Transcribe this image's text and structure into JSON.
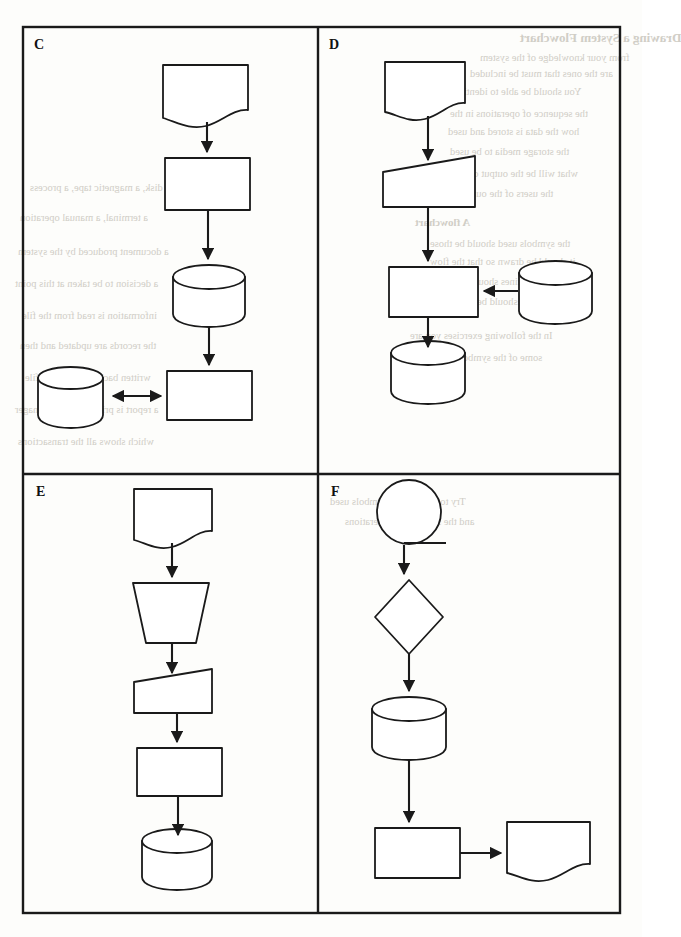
{
  "page": {
    "width": 642,
    "height": 937,
    "background_color": "#fdfdfb",
    "ink_color": "#1a1a1a",
    "bleed_color": "#c9c6bd"
  },
  "figure": {
    "kind": "flowchart-exercise-grid",
    "outer_border": {
      "x": 23,
      "y": 27,
      "width": 597,
      "height": 886
    },
    "divider_vertical_x": 318,
    "divider_horizontal_y": 474,
    "panels": [
      {
        "id": "C",
        "label": "C",
        "label_x": 34,
        "label_y": 48,
        "region": {
          "x": 23,
          "y": 27,
          "width": 295,
          "height": 447
        },
        "nodes": [
          {
            "name": "document",
            "shape": "document",
            "x": 163,
            "y": 65,
            "width": 85,
            "height": 56
          },
          {
            "name": "process",
            "shape": "rectangle",
            "x": 165,
            "y": 158,
            "width": 85,
            "height": 52
          },
          {
            "name": "database",
            "shape": "cylinder",
            "x": 173,
            "y": 264,
            "width": 72,
            "height": 62
          },
          {
            "name": "process-2",
            "shape": "rectangle",
            "x": 167,
            "y": 371,
            "width": 85,
            "height": 49
          },
          {
            "name": "database-2",
            "shape": "cylinder",
            "x": 38,
            "y": 366,
            "width": 65,
            "height": 61
          }
        ],
        "edges": [
          {
            "from": "document",
            "to": "process",
            "direction": "down",
            "arrow": "single"
          },
          {
            "from": "process",
            "to": "database",
            "direction": "down",
            "arrow": "single"
          },
          {
            "from": "database",
            "to": "process-2",
            "direction": "down",
            "arrow": "single"
          },
          {
            "from": "database-2",
            "to": "process-2",
            "direction": "right",
            "arrow": "double"
          }
        ]
      },
      {
        "id": "D",
        "label": "D",
        "label_x": 329,
        "label_y": 48,
        "region": {
          "x": 318,
          "y": 27,
          "width": 302,
          "height": 447
        },
        "nodes": [
          {
            "name": "document",
            "shape": "document",
            "x": 385,
            "y": 62,
            "width": 80,
            "height": 54
          },
          {
            "name": "input-output",
            "shape": "slanted-top-quad",
            "x": 383,
            "y": 156,
            "width": 92,
            "height": 51
          },
          {
            "name": "process",
            "shape": "rectangle",
            "x": 389,
            "y": 267,
            "width": 89,
            "height": 50
          },
          {
            "name": "database-source",
            "shape": "cylinder",
            "x": 519,
            "y": 261,
            "width": 73,
            "height": 62
          },
          {
            "name": "database-sink",
            "shape": "cylinder",
            "x": 391,
            "y": 341,
            "width": 74,
            "height": 62
          }
        ],
        "edges": [
          {
            "from": "document",
            "to": "input-output",
            "direction": "down",
            "arrow": "single"
          },
          {
            "from": "input-output",
            "to": "process",
            "direction": "down",
            "arrow": "single"
          },
          {
            "from": "database-source",
            "to": "process",
            "direction": "left",
            "arrow": "single"
          },
          {
            "from": "process",
            "to": "database-sink",
            "direction": "down",
            "arrow": "single"
          }
        ]
      },
      {
        "id": "E",
        "label": "E",
        "label_x": 36,
        "label_y": 495,
        "region": {
          "x": 23,
          "y": 474,
          "width": 295,
          "height": 439
        },
        "nodes": [
          {
            "name": "document",
            "shape": "document",
            "x": 134,
            "y": 489,
            "width": 78,
            "height": 57
          },
          {
            "name": "manual-operation",
            "shape": "trapezoid",
            "x": 133,
            "y": 583,
            "width": 76,
            "height": 60
          },
          {
            "name": "input-output",
            "shape": "slanted-top-quad",
            "x": 134,
            "y": 669,
            "width": 78,
            "height": 44
          },
          {
            "name": "process",
            "shape": "rectangle",
            "x": 137,
            "y": 748,
            "width": 85,
            "height": 48
          },
          {
            "name": "database",
            "shape": "cylinder",
            "x": 142,
            "y": 829,
            "width": 70,
            "height": 60
          }
        ],
        "edges": [
          {
            "from": "document",
            "to": "manual-operation",
            "direction": "down",
            "arrow": "single"
          },
          {
            "from": "manual-operation",
            "to": "input-output",
            "direction": "down",
            "arrow": "single"
          },
          {
            "from": "input-output",
            "to": "process",
            "direction": "down",
            "arrow": "single"
          },
          {
            "from": "process",
            "to": "database",
            "direction": "down",
            "arrow": "single"
          }
        ]
      },
      {
        "id": "F",
        "label": "F",
        "label_x": 331,
        "label_y": 495,
        "region": {
          "x": 318,
          "y": 474,
          "width": 302,
          "height": 439
        },
        "nodes": [
          {
            "name": "connector-circle",
            "shape": "circle-with-tail",
            "cx": 409,
            "cy": 512,
            "r": 32
          },
          {
            "name": "decision",
            "shape": "diamond",
            "cx": 409,
            "cy": 617,
            "rx": 34,
            "ry": 37
          },
          {
            "name": "database",
            "shape": "cylinder",
            "x": 372,
            "y": 697,
            "width": 74,
            "height": 62
          },
          {
            "name": "process",
            "shape": "rectangle",
            "x": 375,
            "y": 828,
            "width": 85,
            "height": 50
          },
          {
            "name": "document",
            "shape": "document",
            "x": 507,
            "y": 822,
            "width": 83,
            "height": 57
          }
        ],
        "edges": [
          {
            "from": "connector-circle",
            "to": "decision",
            "direction": "down",
            "arrow": "single"
          },
          {
            "from": "decision",
            "to": "database",
            "direction": "down",
            "arrow": "single"
          },
          {
            "from": "database",
            "to": "process",
            "direction": "down",
            "arrow": "single"
          },
          {
            "from": "process",
            "to": "document",
            "direction": "right",
            "arrow": "single"
          }
        ]
      }
    ]
  },
  "bleed_text": {
    "note": "faint mirrored show-through text from the reverse side of the scanned page",
    "lines": [
      {
        "text": "Drawing a System Flowchart",
        "x": 520,
        "y": 30,
        "size": 13,
        "bold": true
      },
      {
        "text": "from your knowledge of the system",
        "x": 480,
        "y": 52,
        "size": 10.5,
        "bold": false
      },
      {
        "text": "are the ones that must be included",
        "x": 470,
        "y": 68,
        "size": 10.5,
        "bold": false
      },
      {
        "text": "You should be able to identify",
        "x": 455,
        "y": 86,
        "size": 10.5,
        "bold": false
      },
      {
        "text": "the sequence of operations in the",
        "x": 450,
        "y": 108,
        "size": 10.5,
        "bold": false
      },
      {
        "text": "how the data is stored and used",
        "x": 448,
        "y": 126,
        "size": 10.5,
        "bold": false
      },
      {
        "text": "the storage media to be used",
        "x": 450,
        "y": 146,
        "size": 10.5,
        "bold": false
      },
      {
        "text": "what will be the output of each",
        "x": 448,
        "y": 168,
        "size": 10.5,
        "bold": false
      },
      {
        "text": "the users of the output",
        "x": 460,
        "y": 188,
        "size": 10.5,
        "bold": false
      },
      {
        "text": "A flowchart",
        "x": 415,
        "y": 216,
        "size": 11,
        "bold": true
      },
      {
        "text": "the symbols used should be those",
        "x": 430,
        "y": 238,
        "size": 10.5,
        "bold": false
      },
      {
        "text": "it should be drawn so that the flow",
        "x": 430,
        "y": 256,
        "size": 10.5,
        "bold": false
      },
      {
        "text": "flow lines should not cross",
        "x": 430,
        "y": 276,
        "size": 10.5,
        "bold": false
      },
      {
        "text": "the chart should be neatly drawn",
        "x": 420,
        "y": 296,
        "size": 10.5,
        "bold": false
      },
      {
        "text": "In the following exercises you are",
        "x": 410,
        "y": 330,
        "size": 10.5,
        "bold": false
      },
      {
        "text": "some of the symbols shown here",
        "x": 405,
        "y": 352,
        "size": 10.5,
        "bold": false
      },
      {
        "text": "a disk, a magnetic tape, a process",
        "x": 30,
        "y": 182,
        "size": 10.5,
        "bold": false
      },
      {
        "text": "a terminal, a manual operation",
        "x": 20,
        "y": 212,
        "size": 10.5,
        "bold": false
      },
      {
        "text": "a document produced by the system",
        "x": 18,
        "y": 246,
        "size": 10.5,
        "bold": false
      },
      {
        "text": "a decision to be taken at this point",
        "x": 15,
        "y": 278,
        "size": 10.5,
        "bold": false
      },
      {
        "text": "information is read from the file",
        "x": 22,
        "y": 310,
        "size": 10.5,
        "bold": false
      },
      {
        "text": "the records are updated and then",
        "x": 20,
        "y": 340,
        "size": 10.5,
        "bold": false
      },
      {
        "text": "written back to the master file",
        "x": 25,
        "y": 372,
        "size": 10.5,
        "bold": false
      },
      {
        "text": "a report is printed for the manager",
        "x": 15,
        "y": 404,
        "size": 10.5,
        "bold": false
      },
      {
        "text": "which shows all the transactions",
        "x": 18,
        "y": 436,
        "size": 10.5,
        "bold": false
      },
      {
        "text": "Try to identify the symbols used",
        "x": 330,
        "y": 496,
        "size": 10.5,
        "bold": false
      },
      {
        "text": "and the sequence of operations",
        "x": 345,
        "y": 516,
        "size": 10.5,
        "bold": false
      }
    ]
  }
}
